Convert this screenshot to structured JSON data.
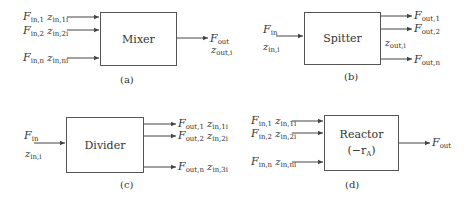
{
  "panels": {
    "a": {
      "caption": "(a)",
      "block_label": "Mixer",
      "inputs": [
        {
          "F": "F",
          "F_sub": "in,1",
          "z": "z",
          "z_sub": "in,1i"
        },
        {
          "F": "F",
          "F_sub": "in,2",
          "z": "z",
          "z_sub": "in,2i"
        },
        {
          "F": "F",
          "F_sub": "in,n",
          "z": "z",
          "z_sub": "in,ni"
        }
      ],
      "outputs": [
        {
          "F": "F",
          "F_sub": "out",
          "z": "z",
          "z_sub": "out,i"
        }
      ]
    },
    "b": {
      "caption": "(b)",
      "block_label": "Spitter",
      "inputs": [
        {
          "F": "F",
          "F_sub": "in",
          "z": "z",
          "z_sub": "in,i"
        }
      ],
      "outputs": [
        {
          "F": "F",
          "F_sub": "out,1"
        },
        {
          "F": "F",
          "F_sub": "out,2"
        },
        {
          "F": "F",
          "F_sub": "out,n"
        }
      ],
      "shared_z": {
        "z": "z",
        "z_sub": "out,i"
      }
    },
    "c": {
      "caption": "(c)",
      "block_label": "Divider",
      "inputs": [
        {
          "F": "F",
          "F_sub": "in",
          "z": "z",
          "z_sub": "in,i"
        }
      ],
      "outputs": [
        {
          "F": "F",
          "F_sub": "out,1",
          "z": "z",
          "z_sub": "in,1i"
        },
        {
          "F": "F",
          "F_sub": "out,2",
          "z": "z",
          "z_sub": "in,2i"
        },
        {
          "F": "F",
          "F_sub": "out,n",
          "z": "z",
          "z_sub": "in,3i"
        }
      ]
    },
    "d": {
      "caption": "(d)",
      "block_label": "Reactor",
      "block_sublabel": "(−r",
      "block_sublabel_sub": "A",
      "block_sublabel_end": ")",
      "inputs": [
        {
          "F": "F",
          "F_sub": "in,1",
          "z": "z",
          "z_sub": "in,1i"
        },
        {
          "F": "F",
          "F_sub": "in,2",
          "z": "z",
          "z_sub": "in,2i"
        },
        {
          "F": "F",
          "F_sub": "in,n",
          "z": "z",
          "z_sub": "in,ni"
        }
      ],
      "outputs": [
        {
          "F": "F",
          "F_sub": "out"
        }
      ]
    }
  }
}
